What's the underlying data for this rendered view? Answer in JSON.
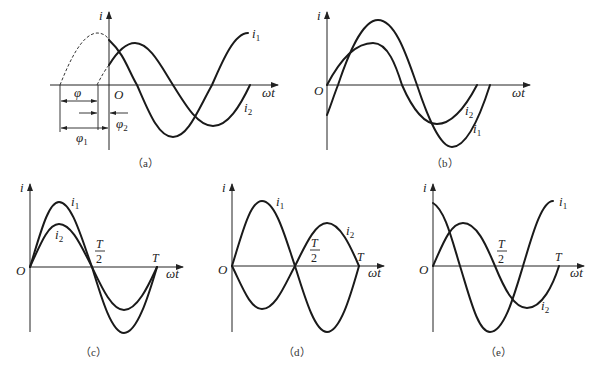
{
  "figure": {
    "panels": [
      {
        "id": "a",
        "caption": "（a）",
        "y_axis_label": "i",
        "x_axis_label": "ωt",
        "origin_label": "O",
        "curves": [
          {
            "name": "i",
            "sub": "1",
            "description": "larger amplitude, leads, peak before origin (dashed before t=0)"
          },
          {
            "name": "i",
            "sub": "2",
            "description": "smaller amplitude, lags i1"
          }
        ],
        "annotations": [
          {
            "symbol": "φ",
            "sub": "",
            "meaning": "phase difference between i1 and i2"
          },
          {
            "symbol": "φ",
            "sub": "1",
            "meaning": "initial phase of i1"
          },
          {
            "symbol": "φ",
            "sub": "2",
            "meaning": "initial phase of i2"
          }
        ]
      },
      {
        "id": "b",
        "caption": "（b）",
        "y_axis_label": "i",
        "x_axis_label": "ωt",
        "origin_label": "O",
        "curves": [
          {
            "name": "i",
            "sub": "1",
            "description": "larger amplitude, starts negative"
          },
          {
            "name": "i",
            "sub": "2",
            "description": "smaller amplitude, starts at zero"
          }
        ]
      },
      {
        "id": "c",
        "caption": "（c）",
        "y_axis_label": "i",
        "x_axis_label": "ωt",
        "origin_label": "O",
        "ticks": [
          {
            "num": "T",
            "den": "2"
          },
          {
            "label": "T"
          }
        ],
        "curves": [
          {
            "name": "i",
            "sub": "1",
            "description": "in phase, larger amplitude"
          },
          {
            "name": "i",
            "sub": "2",
            "description": "in phase, smaller amplitude"
          }
        ]
      },
      {
        "id": "d",
        "caption": "（d）",
        "y_axis_label": "i",
        "x_axis_label": "ωt",
        "origin_label": "O",
        "ticks": [
          {
            "num": "T",
            "den": "2"
          },
          {
            "label": "T"
          }
        ],
        "curves": [
          {
            "name": "i",
            "sub": "1",
            "description": "larger amplitude"
          },
          {
            "name": "i",
            "sub": "2",
            "description": "opposite phase, smaller amplitude"
          }
        ]
      },
      {
        "id": "e",
        "caption": "（e）",
        "y_axis_label": "i",
        "x_axis_label": "ωt",
        "origin_label": "O",
        "ticks": [
          {
            "num": "T",
            "den": "2"
          },
          {
            "label": "T"
          }
        ],
        "curves": [
          {
            "name": "i",
            "sub": "1",
            "description": "larger amplitude, starts at max (leads 90°)"
          },
          {
            "name": "i",
            "sub": "2",
            "description": "smaller amplitude, starts at zero"
          }
        ]
      }
    ]
  }
}
